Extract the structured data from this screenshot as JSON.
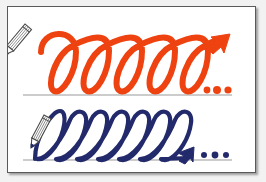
{
  "page": {
    "background_color": "#f2f2f2",
    "card_background": "#ffffff",
    "card_border_color": "#5a5a5a"
  },
  "colors": {
    "orange_stroke": "#ee4310",
    "navy_stroke": "#232a6b",
    "baseline": "#9a9a9a",
    "pencil_body": "#ffffff",
    "pencil_outline": "#4a4a4a",
    "pencil_tip": "#1a1a1a"
  },
  "rows": [
    {
      "id": "row-orange",
      "name": "orange-loop-row",
      "color": "#ee4310",
      "stroke_width": 6,
      "loop_count": 5,
      "loop_style": "open-coil-spring",
      "slant_degrees": 0,
      "baseline_y": 88,
      "baseline_x_start": 15,
      "baseline_x_end": 224,
      "pencil": {
        "name": "pencil-icon-orange-row",
        "x": 17,
        "y": 17,
        "angle_degrees": 40,
        "tip_direction": "down-right"
      },
      "arrow": {
        "name": "arrow-head-orange",
        "direction": "up-right",
        "x": 205,
        "y": 32
      },
      "ellipsis": {
        "name": "ellipsis-orange",
        "dot_count": 3,
        "dots": [
          {
            "cx": 199,
            "cy": 83,
            "r": 3.4
          },
          {
            "cx": 209,
            "cy": 83,
            "r": 4.0
          },
          {
            "cx": 220,
            "cy": 83,
            "r": 3.6
          }
        ]
      }
    },
    {
      "id": "row-navy",
      "name": "navy-loop-row",
      "color": "#232a6b",
      "stroke_width": 4.2,
      "loop_count": 7,
      "loop_style": "narrow-slanted-cursive-l",
      "slant_degrees": 14,
      "baseline_y": 153,
      "baseline_x_start": 15,
      "baseline_x_end": 224,
      "pencil": {
        "name": "pencil-icon-navy-row",
        "x": 22,
        "y": 110,
        "angle_degrees": 28,
        "tip_direction": "down-left"
      },
      "arrow": {
        "name": "arrow-head-navy",
        "direction": "up-right",
        "x": 174,
        "y": 146
      },
      "ellipsis": {
        "name": "ellipsis-navy",
        "dot_count": 3,
        "dots": [
          {
            "cx": 196,
            "cy": 148,
            "r": 3.0
          },
          {
            "cx": 207,
            "cy": 148,
            "r": 3.4
          },
          {
            "cx": 218,
            "cy": 148,
            "r": 3.0
          }
        ]
      }
    }
  ],
  "icons": {
    "pencil": "pencil-icon",
    "arrow": "arrow-head-icon",
    "ellipsis": "ellipsis-dots-icon",
    "baseline": "ruled-baseline"
  },
  "captions": {
    "alt_text": "Two rows of continuous handwriting loops drawn by pencils; the top row in orange has five wide spring loops ending in an arrow and three dots, the bottom row in navy has seven narrow slanted loops ending in an arrow and three dots."
  }
}
